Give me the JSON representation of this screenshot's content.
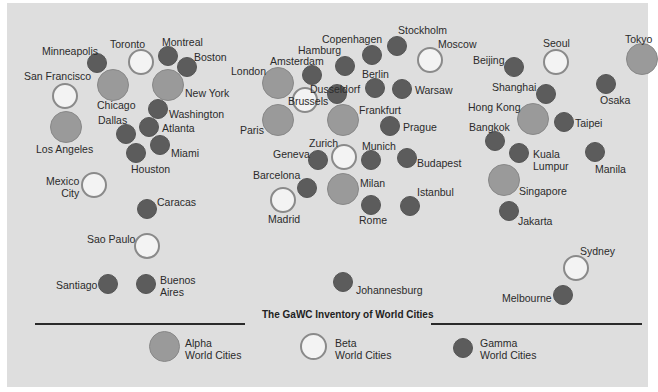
{
  "chart_data": {
    "type": "scatter",
    "title": "The GaWC Inventory of World Cities",
    "legend": [
      {
        "key": "alpha",
        "label_line1": "Alpha",
        "label_line2": "World Cities",
        "color": "#9a9a9a",
        "radius": 16
      },
      {
        "key": "beta",
        "label_line1": "Beta",
        "label_line2": "World Cities",
        "color": "#f3f3f3",
        "radius": 13
      },
      {
        "key": "gamma",
        "label_line1": "Gamma",
        "label_line2": "World Cities",
        "color": "#5c5c5c",
        "radius": 10
      }
    ],
    "cities": [
      {
        "name": "Chicago",
        "tier": "alpha",
        "x": 113,
        "y": 85,
        "lx": 97,
        "ly": 99
      },
      {
        "name": "New York",
        "tier": "alpha",
        "x": 168,
        "y": 85,
        "lx": 185,
        "ly": 87
      },
      {
        "name": "Los Angeles",
        "tier": "alpha",
        "x": 66,
        "y": 127,
        "lx": 36,
        "ly": 143
      },
      {
        "name": "London",
        "tier": "alpha",
        "x": 278,
        "y": 83,
        "lx": 231,
        "ly": 65
      },
      {
        "name": "Paris",
        "tier": "alpha",
        "x": 278,
        "y": 120,
        "lx": 240,
        "ly": 124
      },
      {
        "name": "Frankfurt",
        "tier": "alpha",
        "x": 343,
        "y": 120,
        "lx": 359,
        "ly": 104
      },
      {
        "name": "Milan",
        "tier": "alpha",
        "x": 343,
        "y": 189,
        "lx": 360,
        "ly": 177
      },
      {
        "name": "Hong Kong",
        "tier": "alpha",
        "x": 533,
        "y": 119,
        "lx": 468,
        "ly": 101
      },
      {
        "name": "Singapore",
        "tier": "alpha",
        "x": 504,
        "y": 180,
        "lx": 519,
        "ly": 185
      },
      {
        "name": "Tokyo",
        "tier": "alpha",
        "x": 642,
        "y": 59,
        "lx": 625,
        "ly": 33
      },
      {
        "name": "Toronto",
        "tier": "beta",
        "x": 141,
        "y": 62,
        "lx": 110,
        "ly": 38
      },
      {
        "name": "San Francisco",
        "tier": "beta",
        "x": 65,
        "y": 96,
        "lx": 24,
        "ly": 70
      },
      {
        "name": "Mexico City",
        "tier": "beta",
        "x": 94,
        "y": 185,
        "lx": 46,
        "ly": 175,
        "multiline": true
      },
      {
        "name": "Sao Paulo",
        "tier": "beta",
        "x": 147,
        "y": 246,
        "lx": 87,
        "ly": 233
      },
      {
        "name": "Brussels",
        "tier": "beta",
        "x": 305,
        "y": 100,
        "lx": 288,
        "ly": 95
      },
      {
        "name": "Moscow",
        "tier": "beta",
        "x": 430,
        "y": 60,
        "lx": 438,
        "ly": 38
      },
      {
        "name": "Zurich",
        "tier": "beta",
        "x": 344,
        "y": 157,
        "lx": 309,
        "ly": 137
      },
      {
        "name": "Madrid",
        "tier": "beta",
        "x": 283,
        "y": 200,
        "lx": 268,
        "ly": 213
      },
      {
        "name": "Seoul",
        "tier": "beta",
        "x": 556,
        "y": 62,
        "lx": 543,
        "ly": 37
      },
      {
        "name": "Sydney",
        "tier": "beta",
        "x": 576,
        "y": 268,
        "lx": 580,
        "ly": 245
      },
      {
        "name": "Minneapolis",
        "tier": "gamma",
        "x": 97,
        "y": 63,
        "lx": 42,
        "ly": 45
      },
      {
        "name": "Montreal",
        "tier": "gamma",
        "x": 168,
        "y": 56,
        "lx": 162,
        "ly": 36
      },
      {
        "name": "Boston",
        "tier": "gamma",
        "x": 187,
        "y": 67,
        "lx": 194,
        "ly": 51
      },
      {
        "name": "Washington",
        "tier": "gamma",
        "x": 158,
        "y": 109,
        "lx": 169,
        "ly": 108
      },
      {
        "name": "Atlanta",
        "tier": "gamma",
        "x": 149,
        "y": 127,
        "lx": 162,
        "ly": 122
      },
      {
        "name": "Dallas",
        "tier": "gamma",
        "x": 126,
        "y": 134,
        "lx": 98,
        "ly": 114
      },
      {
        "name": "Miami",
        "tier": "gamma",
        "x": 160,
        "y": 145,
        "lx": 171,
        "ly": 147
      },
      {
        "name": "Houston",
        "tier": "gamma",
        "x": 136,
        "y": 153,
        "lx": 131,
        "ly": 163
      },
      {
        "name": "Caracas",
        "tier": "gamma",
        "x": 147,
        "y": 209,
        "lx": 157,
        "ly": 196
      },
      {
        "name": "Santiago",
        "tier": "gamma",
        "x": 108,
        "y": 284,
        "lx": 56,
        "ly": 279
      },
      {
        "name": "Buenos Aires",
        "tier": "gamma",
        "x": 146,
        "y": 284,
        "lx": 160,
        "ly": 274,
        "multiline": true
      },
      {
        "name": "Amsterdam",
        "tier": "gamma",
        "x": 312,
        "y": 75,
        "lx": 270,
        "ly": 55
      },
      {
        "name": "Hamburg",
        "tier": "gamma",
        "x": 345,
        "y": 66,
        "lx": 298,
        "ly": 44
      },
      {
        "name": "Copenhagen",
        "tier": "gamma",
        "x": 372,
        "y": 55,
        "lx": 322,
        "ly": 33
      },
      {
        "name": "Stockholm",
        "tier": "gamma",
        "x": 397,
        "y": 46,
        "lx": 398,
        "ly": 24
      },
      {
        "name": "Dusseldorf",
        "tier": "gamma",
        "x": 337,
        "y": 94,
        "lx": 310,
        "ly": 83
      },
      {
        "name": "Berlin",
        "tier": "gamma",
        "x": 375,
        "y": 88,
        "lx": 362,
        "ly": 68
      },
      {
        "name": "Warsaw",
        "tier": "gamma",
        "x": 402,
        "y": 89,
        "lx": 415,
        "ly": 84
      },
      {
        "name": "Prague",
        "tier": "gamma",
        "x": 390,
        "y": 126,
        "lx": 403,
        "ly": 121
      },
      {
        "name": "Munich",
        "tier": "gamma",
        "x": 371,
        "y": 160,
        "lx": 362,
        "ly": 140
      },
      {
        "name": "Budapest",
        "tier": "gamma",
        "x": 407,
        "y": 158,
        "lx": 417,
        "ly": 157
      },
      {
        "name": "Geneva",
        "tier": "gamma",
        "x": 318,
        "y": 160,
        "lx": 273,
        "ly": 148
      },
      {
        "name": "Barcelona",
        "tier": "gamma",
        "x": 307,
        "y": 188,
        "lx": 253,
        "ly": 169
      },
      {
        "name": "Rome",
        "tier": "gamma",
        "x": 371,
        "y": 205,
        "lx": 359,
        "ly": 214
      },
      {
        "name": "Istanbul",
        "tier": "gamma",
        "x": 410,
        "y": 206,
        "lx": 417,
        "ly": 186
      },
      {
        "name": "Johannesburg",
        "tier": "gamma",
        "x": 343,
        "y": 282,
        "lx": 356,
        "ly": 284
      },
      {
        "name": "Beijing",
        "tier": "gamma",
        "x": 514,
        "y": 67,
        "lx": 473,
        "ly": 54
      },
      {
        "name": "Shanghai",
        "tier": "gamma",
        "x": 546,
        "y": 94,
        "lx": 492,
        "ly": 81
      },
      {
        "name": "Taipei",
        "tier": "gamma",
        "x": 564,
        "y": 122,
        "lx": 575,
        "ly": 117
      },
      {
        "name": "Bangkok",
        "tier": "gamma",
        "x": 495,
        "y": 141,
        "lx": 469,
        "ly": 121
      },
      {
        "name": "Kuala Lumpur",
        "tier": "gamma",
        "x": 519,
        "y": 153,
        "lx": 533,
        "ly": 148,
        "multiline": true
      },
      {
        "name": "Manila",
        "tier": "gamma",
        "x": 595,
        "y": 152,
        "lx": 595,
        "ly": 163
      },
      {
        "name": "Osaka",
        "tier": "gamma",
        "x": 606,
        "y": 84,
        "lx": 600,
        "ly": 94
      },
      {
        "name": "Jakarta",
        "tier": "gamma",
        "x": 509,
        "y": 211,
        "lx": 518,
        "ly": 215
      },
      {
        "name": "Melbourne",
        "tier": "gamma",
        "x": 563,
        "y": 295,
        "lx": 502,
        "ly": 292
      }
    ],
    "xlabel": "",
    "ylabel": ""
  },
  "labels": {
    "mexico_city": [
      "Mexico",
      "City"
    ],
    "buenos_aires": [
      "Buenos",
      "Aires"
    ],
    "kuala_lumpur": [
      "Kuala",
      "Lumpur"
    ]
  },
  "footer": {
    "title": "The GaWC Inventory of World Cities",
    "legend": {
      "alpha": {
        "line1": "Alpha",
        "line2": "World Cities"
      },
      "beta": {
        "line1": "Beta",
        "line2": "World Cities"
      },
      "gamma": {
        "line1": "Gamma",
        "line2": "World Cities"
      }
    }
  }
}
